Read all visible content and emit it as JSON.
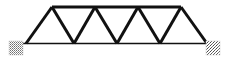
{
  "figure": {
    "width": 230,
    "height": 64,
    "background_color": "#ffffff",
    "line_color": "#111111",
    "support_fill_color": "#8a8a8a"
  },
  "diagram_data": {
    "type": "line-diagram",
    "subject": "warren-truss",
    "panel_count": 4,
    "triangle_count": 8,
    "top_chord": {
      "label": "top chord",
      "y": 7,
      "x_start": 52,
      "x_end": 181,
      "stroke_width": 3.2
    },
    "bottom_chord": {
      "label": "bottom chord",
      "y": 43.5,
      "x_start": 22,
      "x_end": 211,
      "stroke_width": 1.7
    },
    "top_nodes": [
      {
        "name": "U1",
        "x": 52,
        "y": 7
      },
      {
        "name": "U2",
        "x": 95,
        "y": 7
      },
      {
        "name": "U3",
        "x": 138,
        "y": 7
      },
      {
        "name": "U4",
        "x": 181,
        "y": 7
      }
    ],
    "bottom_nodes": [
      {
        "name": "L0",
        "x": 26,
        "y": 43.5
      },
      {
        "name": "L1",
        "x": 74,
        "y": 43.5
      },
      {
        "name": "L2",
        "x": 117,
        "y": 43.5
      },
      {
        "name": "L3",
        "x": 160,
        "y": 43.5
      },
      {
        "name": "L4",
        "x": 207,
        "y": 43.5
      }
    ],
    "web_members": [
      {
        "name": "end-diagonal-left",
        "x1": 26,
        "y1": 43.5,
        "x2": 52,
        "y2": 7
      },
      {
        "name": "diagonal-1",
        "x1": 52,
        "y1": 7,
        "x2": 74,
        "y2": 43.5
      },
      {
        "name": "diagonal-2",
        "x1": 74,
        "y1": 43.5,
        "x2": 95,
        "y2": 7
      },
      {
        "name": "diagonal-3",
        "x1": 95,
        "y1": 7,
        "x2": 117,
        "y2": 43.5
      },
      {
        "name": "diagonal-4",
        "x1": 117,
        "y1": 43.5,
        "x2": 138,
        "y2": 7
      },
      {
        "name": "diagonal-5",
        "x1": 138,
        "y1": 7,
        "x2": 160,
        "y2": 43.5
      },
      {
        "name": "diagonal-6",
        "x1": 160,
        "y1": 43.5,
        "x2": 181,
        "y2": 7
      },
      {
        "name": "end-diagonal-right",
        "x1": 181,
        "y1": 7,
        "x2": 207,
        "y2": 43.5
      }
    ],
    "web_stroke_width": 3.0,
    "supports": [
      {
        "name": "left-support",
        "label": "hatched abutment",
        "x": 9,
        "y": 41,
        "width": 14,
        "height": 14
      },
      {
        "name": "right-support",
        "label": "hatched abutment",
        "x": 206,
        "y": 41,
        "width": 14,
        "height": 14
      }
    ],
    "axis_labels": [],
    "annotations": [],
    "legend": []
  }
}
